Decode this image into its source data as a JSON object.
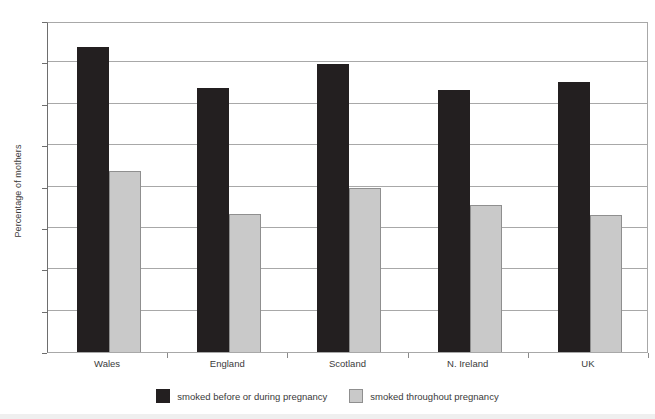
{
  "chart_data": {
    "type": "bar",
    "title": "",
    "xlabel": "",
    "ylabel": "Percentage of mothers",
    "categories": [
      "Wales",
      "England",
      "Scotland",
      "N. Ireland",
      "UK"
    ],
    "series": [
      {
        "name": "smoked before or during pregnancy",
        "color": "#231f20",
        "values": [
          36.9,
          31.9,
          34.8,
          31.7,
          32.6
        ]
      },
      {
        "name": "smoked throughout pregnancy",
        "color": "#c9c9c9",
        "values": [
          21.9,
          16.7,
          19.8,
          17.8,
          16.6
        ]
      }
    ],
    "ylim": [
      0,
      40
    ],
    "yticks": [
      0,
      5,
      10,
      15,
      20,
      25,
      30,
      35,
      40
    ],
    "ytick_labels": [
      "0",
      "5",
      "10",
      "15",
      "20",
      "25",
      "30",
      "35",
      "40"
    ],
    "grid": true,
    "grid_axis": "y",
    "legend_position": "bottom"
  },
  "legend": {
    "items": [
      {
        "label": "smoked before or during pregnancy",
        "swatch": "dark"
      },
      {
        "label": "smoked throughout pregnancy",
        "swatch": "light"
      }
    ]
  }
}
